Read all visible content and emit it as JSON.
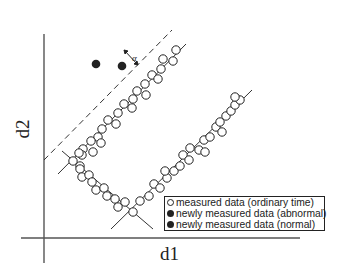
{
  "axes": {
    "x_label": "d1",
    "y_label": "d2"
  },
  "annotation": {
    "alpha_label": "α"
  },
  "legend": {
    "items": [
      {
        "marker": "open-circle",
        "label": "measured data (ordinary time)"
      },
      {
        "marker": "filled-circle",
        "label": "newly measured data (abnormal)"
      },
      {
        "marker": "filled-circle",
        "label": "newly measured data (normal)"
      }
    ]
  },
  "colors": {
    "line": "#222222",
    "background": "#ffffff"
  }
}
